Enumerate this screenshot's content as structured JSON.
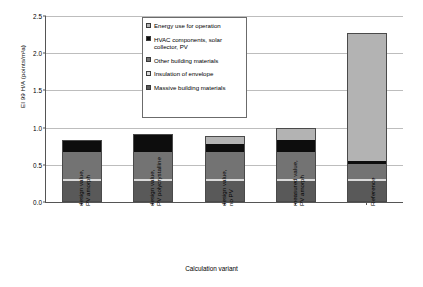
{
  "chart_data": {
    "type": "bar",
    "subtype": "stacked-bar",
    "title": "",
    "xlabel": "Calculation variant",
    "ylabel": "EI 99 H/A (points/m²a)",
    "ylim": [
      0,
      2.5
    ],
    "yticks": [
      "0.0",
      "0.5",
      "1.0",
      "1.5",
      "2.0",
      "2.5"
    ],
    "ytick_values": [
      0,
      0.5,
      1.0,
      1.5,
      2.0,
      2.5
    ],
    "grid": true,
    "legend_position": "inside-top-center",
    "categories": [
      "design value, PV amorph",
      "design value, PV polycrystalline",
      "design value, no PV",
      "measured value, PV amorph",
      "Reference"
    ],
    "series": [
      {
        "name": "Massive building materials",
        "color": "#595959",
        "values": [
          0.28,
          0.28,
          0.28,
          0.28,
          0.28
        ]
      },
      {
        "name": "Insulation of envelope",
        "color": "#d9d9d9",
        "values": [
          0.035,
          0.035,
          0.035,
          0.035,
          0.035
        ]
      },
      {
        "name": "Other building materials",
        "color": "#737373",
        "values": [
          0.355,
          0.355,
          0.355,
          0.355,
          0.19
        ]
      },
      {
        "name": "HVAC components, solar collector, PV",
        "color": "#0d0d0d",
        "values": [
          0.16,
          0.25,
          0.11,
          0.16,
          0.05
        ]
      },
      {
        "name": "Energy use for operation",
        "color": "#b3b3b3",
        "values": [
          0.0,
          0.0,
          0.11,
          0.16,
          1.71
        ]
      }
    ],
    "totals": [
      0.83,
      0.92,
      0.89,
      0.99,
      2.265
    ],
    "legend_entries": [
      "Energy use for operation",
      "HVAC components, solar collector, PV",
      "Other building materials",
      "Insulation of envelope",
      "Massive building materials"
    ],
    "legend_swatch_colors": [
      "#b3b3b3",
      "#0d0d0d",
      "#737373",
      "#d9d9d9",
      "#595959"
    ]
  },
  "axis_colors": {
    "axis_line": "#555555",
    "gridline": "#bdbdbd",
    "background": "#ffffff"
  }
}
